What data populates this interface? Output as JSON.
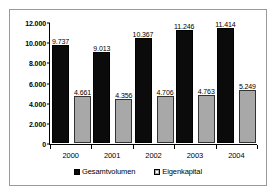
{
  "chart_data": {
    "type": "bar",
    "title": "",
    "subtitle": "",
    "xlabel": "",
    "ylabel": "",
    "categories": [
      "2000",
      "2001",
      "2002",
      "2003",
      "2004"
    ],
    "series": [
      {
        "name": "Gesamtvolumen",
        "color": "#0b0b0b",
        "values": [
          9737,
          9013,
          10367,
          11246,
          11414
        ],
        "labels": [
          "9.737",
          "9.013",
          "10.367",
          "11.246",
          "11.414"
        ]
      },
      {
        "name": "Eigenkapital",
        "color": "#a8a8a8",
        "values": [
          4661,
          4356,
          4706,
          4763,
          5249
        ],
        "labels": [
          "4.661",
          "4.356",
          "4.706",
          "4.763",
          "5.249"
        ]
      }
    ],
    "ylim": [
      0,
      12000
    ],
    "yticks": [
      0,
      2000,
      4000,
      6000,
      8000,
      10000,
      12000
    ],
    "ytick_labels": [
      "0",
      "2.000",
      "4.000",
      "6.000",
      "8.000",
      "10.000",
      "12.000"
    ],
    "grid": false,
    "legend_position": "bottom"
  },
  "legend": {
    "items": [
      {
        "label": "Gesamtvolumen"
      },
      {
        "label": "Eigenkapital"
      }
    ]
  }
}
